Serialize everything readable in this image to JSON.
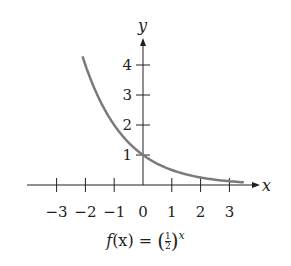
{
  "chart_data": {
    "type": "line",
    "xlabel": "x",
    "ylabel": "y",
    "xlim": [
      -3.2,
      3.6
    ],
    "ylim": [
      0,
      4.8
    ],
    "grid": false,
    "x_ticks": [
      -3,
      -2,
      -1,
      0,
      1,
      2,
      3
    ],
    "x_tick_labels": [
      "−3",
      "−2",
      "−1",
      "0",
      "1",
      "2",
      "3"
    ],
    "y_ticks": [
      1,
      2,
      3,
      4
    ],
    "y_tick_labels": [
      "1",
      "2",
      "3",
      "4"
    ],
    "series": [
      {
        "name": "f(x) = (1/2)^x",
        "color": "#7a7a7a",
        "x": [
          -2.1,
          -2,
          -1.5,
          -1,
          -0.5,
          0,
          0.5,
          1,
          1.5,
          2,
          2.5,
          3,
          3.5
        ],
        "y": [
          4.29,
          4,
          2.83,
          2,
          1.41,
          1,
          0.71,
          0.5,
          0.35,
          0.25,
          0.18,
          0.125,
          0.09
        ]
      }
    ]
  },
  "labels": {
    "x_axis": "x",
    "y_axis": "y",
    "caption_prefix": "f",
    "caption_arg": "(x) = ",
    "caption_num": "1",
    "caption_den": "2",
    "caption_exp": "x"
  }
}
